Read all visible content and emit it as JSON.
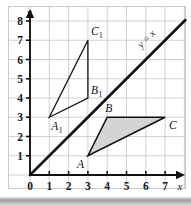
{
  "figure": {
    "title": "",
    "background_color": "#ffffff",
    "frame_color": "#c9c9c9"
  },
  "chart_data": {
    "type": "scatter",
    "title": "",
    "xlabel": "x",
    "ylabel": "y",
    "xlim": [
      0,
      7.6
    ],
    "ylim": [
      0,
      8.6
    ],
    "x_ticks": [
      0,
      1,
      2,
      3,
      4,
      5,
      6,
      7
    ],
    "y_ticks": [
      0,
      1,
      2,
      3,
      4,
      5,
      6,
      7,
      8
    ],
    "x_tick_labels": [
      "0",
      "1",
      "2",
      "3",
      "4",
      "5",
      "6",
      "7"
    ],
    "y_tick_labels": [
      "0",
      "1",
      "2",
      "3",
      "4",
      "5",
      "6",
      "7",
      "8"
    ],
    "grid": true,
    "grid_color": "#bfc4cc",
    "legend": false,
    "axis_color": "#111111",
    "annotations": [
      {
        "name": "line-y-equals-x-label",
        "text": "y = x",
        "x": 6.15,
        "y": 6.95,
        "rotation": -45
      }
    ],
    "series": [
      {
        "name": "triangle-ABC",
        "type": "polygon",
        "closed": true,
        "filled": true,
        "fill_color": "#d4d4d4",
        "stroke_color": "#111111",
        "stroke_width": 1.6,
        "points": [
          {
            "label": "A",
            "x": 3,
            "y": 1,
            "label_dx": -11,
            "label_dy": 12
          },
          {
            "label": "B",
            "x": 4,
            "y": 3,
            "label_dx": -2,
            "label_dy": -5
          },
          {
            "label": "C",
            "x": 7,
            "y": 3,
            "label_dx": 4,
            "label_dy": 12
          }
        ]
      },
      {
        "name": "triangle-A1B1C1",
        "type": "polygon",
        "closed": true,
        "filled": false,
        "fill_color": "none",
        "stroke_color": "#111111",
        "stroke_width": 1.3,
        "points": [
          {
            "label": "A",
            "sub": "1",
            "x": 1,
            "y": 3,
            "label_dx": 2,
            "label_dy": 13
          },
          {
            "label": "B",
            "sub": "1",
            "x": 3,
            "y": 4,
            "label_dx": 3,
            "label_dy": -4
          },
          {
            "label": "C",
            "sub": "1",
            "x": 3,
            "y": 7,
            "label_dx": 3,
            "label_dy": -5
          }
        ]
      },
      {
        "name": "line-y-equals-x",
        "type": "line",
        "equation": "y = x",
        "stroke_color": "#111111",
        "stroke_width": 2.6,
        "x_start": 0,
        "y_start": 0,
        "x_end": 8.05,
        "y_end": 8.05
      }
    ]
  }
}
